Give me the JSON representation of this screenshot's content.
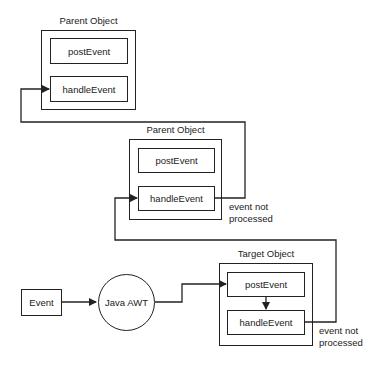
{
  "diagram": {
    "parent_object_1": {
      "title": "Parent Object",
      "post_event": "postEvent",
      "handle_event": "handleEvent"
    },
    "parent_object_2": {
      "title": "Parent Object",
      "post_event": "postEvent",
      "handle_event": "handleEvent",
      "note_line1": "event not",
      "note_line2": "processed"
    },
    "target_object": {
      "title": "Target Object",
      "post_event": "postEvent",
      "handle_event": "handleEvent",
      "note_line1": "event not",
      "note_line2": "processed"
    },
    "event_node": {
      "label": "Event"
    },
    "java_awt_node": {
      "label": "Java AWT"
    },
    "colors": {
      "stroke": "#222222",
      "background": "#ffffff"
    }
  }
}
